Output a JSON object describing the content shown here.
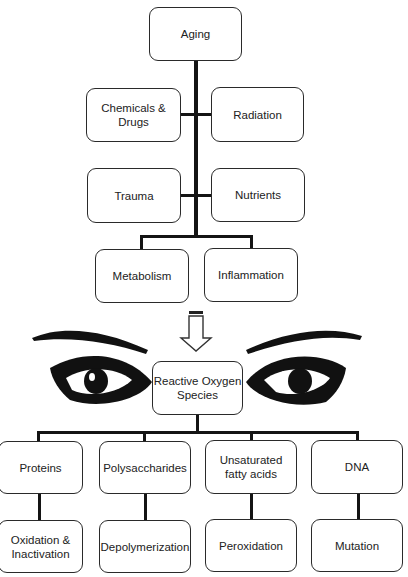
{
  "diagram": {
    "top_chain": {
      "root": "Aging",
      "factors": [
        "Chemicals & Drugs",
        "Radiation",
        "Trauma",
        "Nutrients"
      ],
      "processes": [
        "Metabolism",
        "Inflammation"
      ]
    },
    "arrow": "down-arrow",
    "center": "Reactive Oxygen Species",
    "center_lines": [
      "Reactive Oxygen",
      "Species"
    ],
    "targets": [
      {
        "name": "Proteins",
        "effect_lines": [
          "Oxidation &",
          "Inactivation"
        ]
      },
      {
        "name": "Polysaccharides",
        "effect_lines": [
          "Depolymerization"
        ]
      },
      {
        "name_lines": [
          "Unsaturated",
          "fatty acids"
        ],
        "effect_lines": [
          "Peroxidation"
        ]
      },
      {
        "name": "DNA",
        "effect_lines": [
          "Mutation"
        ]
      }
    ],
    "decoration": "pair-of-eyes"
  }
}
